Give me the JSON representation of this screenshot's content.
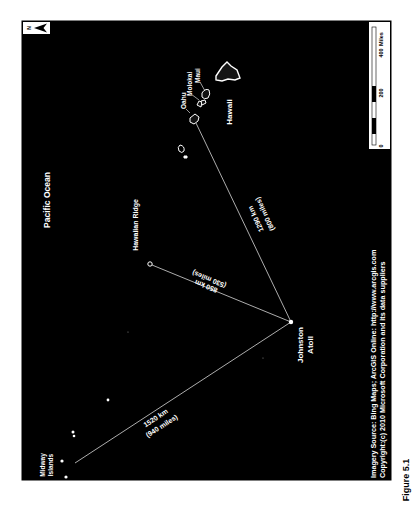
{
  "figure": {
    "caption": "Figure 5.1"
  },
  "map": {
    "background_color": "#000000",
    "feature_color": "#ffffff",
    "north_arrow": {
      "label": "N"
    },
    "ocean_label": "Pacific Ocean",
    "ridge_label": "Hawaiian Ridge",
    "places": {
      "midway": {
        "line1": "Midway",
        "line2": "Islands"
      },
      "johnston": {
        "line1": "Johnston",
        "line2": "Atoll"
      },
      "oahu": "Oahu",
      "molokai": "Molokai",
      "maui": "Maui",
      "hawaii": "Hawaii"
    },
    "distances": [
      {
        "to": "Midway Islands",
        "km": "1520 km",
        "miles": "(940 miles)"
      },
      {
        "to": "Hawaiian Ridge",
        "km": "850 km",
        "miles": "(530 miles)"
      },
      {
        "to": "Oahu",
        "km": "1290 km",
        "miles": "(800 miles)"
      }
    ],
    "scale_bar": {
      "unit": "Miles",
      "ticks": [
        "0",
        "200",
        "400"
      ]
    },
    "credits": {
      "line1": "Imagery Source:  Bing Maps; ArcGIS Online: http://www.arcgis.com",
      "line2": "Copyright:(c) 2010 Microsoft Corporation and its data suppliers"
    }
  }
}
